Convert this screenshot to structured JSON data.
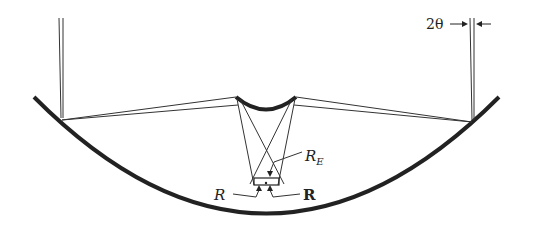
{
  "diagram": {
    "type": "optical-ray-diagram",
    "components": [
      {
        "name": "primary-mirror",
        "shape": "concave"
      },
      {
        "name": "secondary-mirror",
        "shape": "convex"
      },
      {
        "name": "focal-plane-detector"
      }
    ],
    "labels": {
      "angle": "2θ",
      "re_base": "R",
      "re_sub": "E",
      "r_italic": "R",
      "r_bold": "R"
    },
    "colors": {
      "ink": "#222222",
      "background": "#ffffff"
    }
  }
}
